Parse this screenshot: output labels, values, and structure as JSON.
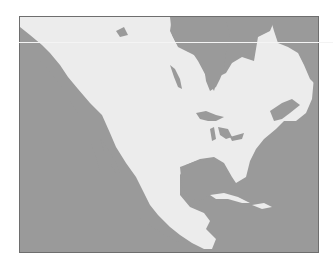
{
  "map": {
    "region": "North America",
    "colors": {
      "land": "#ececec",
      "water": "#9a9a9a",
      "border": "#6e6e6e"
    },
    "features": [
      "Hudson Bay",
      "Great Lakes",
      "Gulf of Mexico",
      "Caribbean islands",
      "Baja California",
      "Gulf of St. Lawrence"
    ]
  }
}
